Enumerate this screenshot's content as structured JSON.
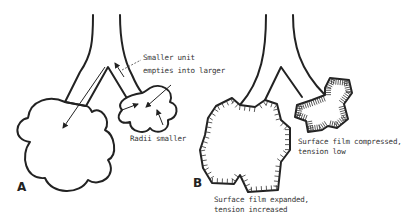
{
  "diagram": {
    "panels": [
      {
        "id": "A",
        "label": "A",
        "annotations": {
          "smaller_unit_line1": "Smaller unit",
          "smaller_unit_line2": "empties into larger",
          "radii": "Radii smaller"
        }
      },
      {
        "id": "B",
        "label": "B",
        "annotations": {
          "compressed_line1": "Surface film compressed,",
          "compressed_line2": "tension low",
          "expanded_line1": "Surface film expanded,",
          "expanded_line2": "tension increased"
        }
      }
    ],
    "colors": {
      "ink": "#222222",
      "background": "#ffffff"
    }
  }
}
